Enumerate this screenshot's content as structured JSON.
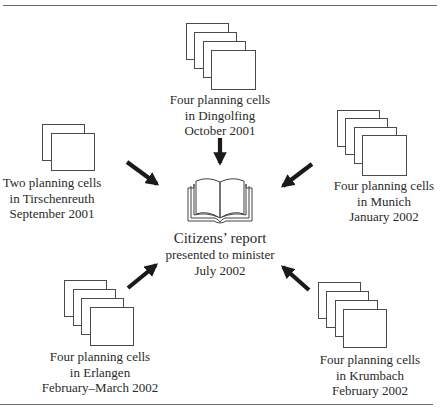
{
  "diagram": {
    "center": {
      "icon": "open-book-icon",
      "lines": [
        "Citizens’ report",
        "presented to minister",
        "July 2002"
      ]
    },
    "sources": [
      {
        "id": "dingolfing",
        "position": "top",
        "cell_count": 4,
        "lines": [
          "Four planning cells",
          "in Dingolfing",
          "October 2001"
        ]
      },
      {
        "id": "tirschenreuth",
        "position": "left",
        "cell_count": 2,
        "lines": [
          "Two planning cells",
          "in Tirschenreuth",
          "September 2001"
        ]
      },
      {
        "id": "munich",
        "position": "right",
        "cell_count": 4,
        "lines": [
          "Four planning cells",
          "in Munich",
          "January 2002"
        ]
      },
      {
        "id": "erlangen",
        "position": "bottom-left",
        "cell_count": 4,
        "lines": [
          "Four planning cells",
          "in Erlangen",
          "February–March 2002"
        ]
      },
      {
        "id": "krumbach",
        "position": "bottom-right",
        "cell_count": 4,
        "lines": [
          "Four planning cells",
          "in Krumbach",
          "February 2002"
        ]
      }
    ],
    "arrows": [
      {
        "from": "dingolfing",
        "to": "center",
        "direction": "down"
      },
      {
        "from": "tirschenreuth",
        "to": "center",
        "direction": "down-right"
      },
      {
        "from": "munich",
        "to": "center",
        "direction": "down-left"
      },
      {
        "from": "erlangen",
        "to": "center",
        "direction": "up-right"
      },
      {
        "from": "krumbach",
        "to": "center",
        "direction": "up-left"
      }
    ],
    "colors": {
      "arrow": "#1a1a1a",
      "page_border": "#4a4a4a",
      "rule": "#6a6a6a",
      "text": "#2a2a2a"
    }
  }
}
